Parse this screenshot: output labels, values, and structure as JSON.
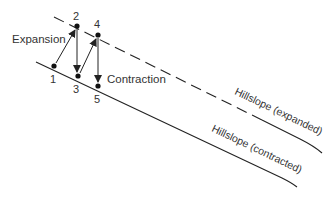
{
  "diagram": {
    "labels": {
      "expansion": "Expansion",
      "contraction": "Contraction",
      "hillslope_expanded": "Hillslope (expanded)",
      "hillslope_contracted": "Hillslope (contracted)"
    },
    "points": [
      {
        "id": "1",
        "label": "1"
      },
      {
        "id": "2",
        "label": "2"
      },
      {
        "id": "3",
        "label": "3"
      },
      {
        "id": "4",
        "label": "4"
      },
      {
        "id": "5",
        "label": "5"
      }
    ],
    "colors": {
      "line": "#222222",
      "text": "#333333"
    }
  }
}
